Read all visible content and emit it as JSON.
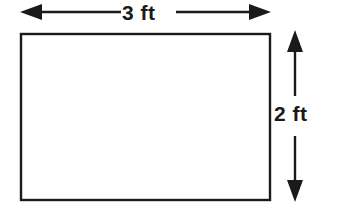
{
  "figure": {
    "shape": "rectangle",
    "stroke_color": "#1a1a1a",
    "fill_color": "#ffffff",
    "background_color": "#ffffff"
  },
  "labels": {
    "width": "3 ft",
    "height": "2 ft"
  },
  "dimensions": {
    "width_value": 3,
    "height_value": 2,
    "unit": "ft"
  },
  "annotations": {
    "width_arrow": "horizontal-double-arrow",
    "height_arrow": "vertical-double-arrow"
  }
}
